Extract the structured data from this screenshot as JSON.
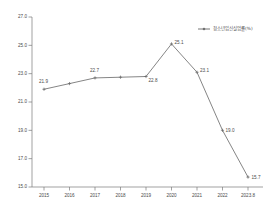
{
  "chart_data": {
    "type": "line",
    "title": "",
    "xlabel": "",
    "ylabel": "",
    "grid": false,
    "legend_position": "top-right",
    "categories": [
      "2015",
      "2016",
      "2017",
      "2018",
      "2019",
      "2020",
      "2021",
      "2022",
      "2023.8"
    ],
    "series": [
      {
        "name": "청소년임신실업률(%)",
        "values": [
          21.9,
          22.3,
          22.7,
          22.75,
          22.8,
          25.1,
          23.1,
          19.0,
          15.7
        ],
        "point_labels": [
          "21.9",
          "",
          "22.7",
          "",
          "22.8",
          "25.1",
          "23.1",
          "19.0",
          "15.7"
        ],
        "color": "#666666"
      }
    ],
    "ylim": [
      15.0,
      27.0
    ],
    "yticks": [
      15.0,
      17.0,
      19.0,
      21.0,
      23.0,
      25.0,
      27.0
    ],
    "ytick_labels": [
      "15.0",
      "17.0",
      "19.0",
      "21.0",
      "23.0",
      "25.0",
      "27.0"
    ],
    "xtick_labels": [
      "2015",
      "2016",
      "2017",
      "2018",
      "2019",
      "2020",
      "2021",
      "2022",
      "2023.8"
    ]
  },
  "legend": {
    "entries": [
      {
        "label": "청소년임신실업률(%)",
        "marker": "line-with-dot",
        "color": "#666666"
      }
    ]
  },
  "axes": {
    "axis_color": "#7a7a7a",
    "label_color": "#4a4a4a"
  }
}
